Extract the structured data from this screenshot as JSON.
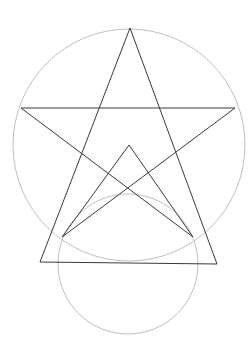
{
  "diagram": {
    "colors": {
      "background": "#ffffff",
      "circle_stroke": "#b8b8b8",
      "line_stroke": "#3a3a3a"
    },
    "circles": [
      {
        "name": "circumcircle",
        "cx": 129,
        "cy": 145,
        "r": 116
      },
      {
        "name": "lower-circle",
        "cx": 128,
        "cy": 264,
        "r": 70
      }
    ],
    "points": {
      "star_top": [
        130,
        28
      ],
      "star_left": [
        21,
        108
      ],
      "star_right": [
        235,
        108
      ],
      "small_tri_apex": [
        129,
        145
      ],
      "small_tri_left": [
        62,
        237
      ],
      "small_tri_right": [
        193,
        237
      ],
      "big_tri_left": [
        40,
        262
      ],
      "big_tri_right": [
        217,
        264
      ]
    }
  }
}
